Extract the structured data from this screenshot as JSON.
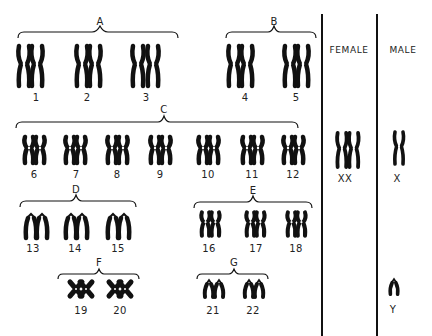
{
  "columns": {
    "female": "FEMALE",
    "male": "MALE"
  },
  "groups": [
    {
      "id": "A",
      "label": "A",
      "chromosomes": [
        "1",
        "2",
        "3"
      ]
    },
    {
      "id": "B",
      "label": "B",
      "chromosomes": [
        "4",
        "5"
      ]
    },
    {
      "id": "C",
      "label": "C",
      "chromosomes": [
        "6",
        "7",
        "8",
        "9",
        "10",
        "11",
        "12"
      ]
    },
    {
      "id": "D",
      "label": "D",
      "chromosomes": [
        "13",
        "14",
        "15"
      ]
    },
    {
      "id": "E",
      "label": "E",
      "chromosomes": [
        "16",
        "17",
        "18"
      ]
    },
    {
      "id": "F",
      "label": "F",
      "chromosomes": [
        "19",
        "20"
      ]
    },
    {
      "id": "G",
      "label": "G",
      "chromosomes": [
        "21",
        "22"
      ]
    }
  ],
  "sex_chromosomes": {
    "female": "XX",
    "male_x": "X",
    "male_y": "Y"
  },
  "colors": {
    "ink": "#111111",
    "background": "#ffffff"
  }
}
